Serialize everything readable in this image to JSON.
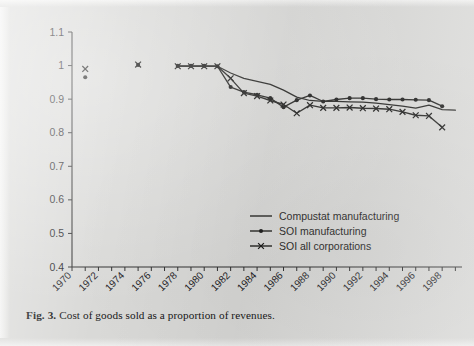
{
  "figure": {
    "caption_label": "Fig. 3.",
    "caption_text": "Cost of goods sold as a proportion of revenues.",
    "background_color": "#d9d9d7",
    "ink_color": "#1d1d1b"
  },
  "chart_data": {
    "type": "line",
    "title": "",
    "subtitle": "",
    "xlabel": "",
    "ylabel": "",
    "xlim": [
      1970,
      1999.5
    ],
    "ylim": [
      0.4,
      1.1
    ],
    "yticks": [
      "0.4",
      "0.5",
      "0.6",
      "0.7",
      "0.8",
      "0.9",
      "1",
      "1.1"
    ],
    "ytick_values": [
      0.4,
      0.5,
      0.6,
      0.7,
      0.8,
      0.9,
      1.0,
      1.1
    ],
    "xticks": [
      "1970",
      "1972",
      "1974",
      "1976",
      "1978",
      "1980",
      "1982",
      "1984",
      "1986",
      "1988",
      "1990",
      "1992",
      "1994",
      "1996",
      "1998"
    ],
    "xtick_values": [
      1970,
      1972,
      1974,
      1976,
      1978,
      1980,
      1982,
      1984,
      1986,
      1988,
      1990,
      1992,
      1994,
      1996,
      1998
    ],
    "minor_xtick_step": 1,
    "grid": false,
    "legend_position": "lower-right-inside",
    "series": [
      {
        "name": "Compustat manufacturing",
        "marker": "none",
        "x": [
          1981,
          1982,
          1983,
          1984,
          1985,
          1986,
          1987,
          1988,
          1989,
          1990,
          1991,
          1992,
          1993,
          1994,
          1995,
          1996,
          1997,
          1998,
          1999
        ],
        "values": [
          0.998,
          0.978,
          0.962,
          0.953,
          0.944,
          0.927,
          0.906,
          0.896,
          0.893,
          0.893,
          0.892,
          0.891,
          0.888,
          0.884,
          0.879,
          0.873,
          0.882,
          0.869,
          0.867
        ]
      },
      {
        "name": "SOI manufacturing",
        "marker": "dot",
        "x": [
          1971,
          1975,
          1978,
          1979,
          1980,
          1981,
          1982,
          1983,
          1984,
          1985,
          1986,
          1987,
          1988,
          1989,
          1990,
          1991,
          1992,
          1993,
          1994,
          1995,
          1996,
          1997,
          1998
        ],
        "values": [
          0.965,
          1.002,
          0.999,
          0.999,
          0.999,
          0.998,
          0.936,
          0.921,
          0.913,
          0.903,
          0.876,
          0.897,
          0.911,
          0.893,
          0.899,
          0.903,
          0.903,
          0.9,
          0.899,
          0.899,
          0.898,
          0.897,
          0.879
        ]
      },
      {
        "name": "SOI all corporations",
        "marker": "x",
        "x": [
          1971,
          1975,
          1978,
          1979,
          1980,
          1981,
          1982,
          1983,
          1984,
          1985,
          1986,
          1987,
          1988,
          1989,
          1990,
          1991,
          1992,
          1993,
          1994,
          1995,
          1996,
          1997,
          1998
        ],
        "values": [
          0.99,
          1.003,
          0.998,
          0.998,
          0.998,
          0.998,
          0.962,
          0.918,
          0.909,
          0.896,
          0.884,
          0.858,
          0.882,
          0.874,
          0.874,
          0.875,
          0.873,
          0.872,
          0.87,
          0.862,
          0.852,
          0.85,
          0.816
        ]
      }
    ],
    "legend": [
      {
        "label": "Compustat manufacturing",
        "marker": "none"
      },
      {
        "label": "SOI manufacturing",
        "marker": "dot"
      },
      {
        "label": "SOI all corporations",
        "marker": "x"
      }
    ]
  }
}
